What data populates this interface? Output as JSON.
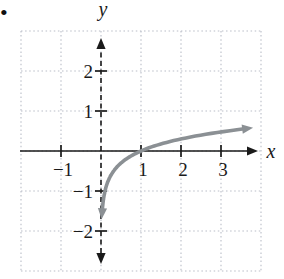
{
  "bullet": {
    "symbol": "•",
    "color": "#111111"
  },
  "chart_data": {
    "type": "line",
    "title": "",
    "function": "y = log10(x)",
    "function_name": "log10",
    "xlabel": "x",
    "ylabel": "y",
    "xlim": [
      -2,
      4
    ],
    "ylim": [
      -3,
      3
    ],
    "x_range_drawn": [
      0.033,
      3.58
    ],
    "x_ticks": [
      {
        "v": -1,
        "label": "−1"
      },
      {
        "v": 1,
        "label": "1"
      },
      {
        "v": 2,
        "label": "2"
      },
      {
        "v": 3,
        "label": "3"
      }
    ],
    "y_ticks": [
      {
        "v": 2,
        "label": "2"
      },
      {
        "v": 1,
        "label": "1"
      },
      {
        "v": -1,
        "label": "−1"
      },
      {
        "v": -2,
        "label": "−2"
      }
    ],
    "grid": true,
    "grid_style": "dotted",
    "asymptote": {
      "axis": "y-axis",
      "x": 0,
      "drawn": "dashed"
    },
    "series": [
      {
        "name": "y = log10(x)",
        "points": [
          [
            0.033,
            -1.48
          ],
          [
            0.1,
            -1
          ],
          [
            0.25,
            -0.6
          ],
          [
            0.5,
            -0.3
          ],
          [
            1,
            0
          ],
          [
            2,
            0.3
          ],
          [
            3,
            0.48
          ],
          [
            3.58,
            0.55
          ]
        ]
      }
    ],
    "key_points": [
      {
        "x": 1,
        "y": 0,
        "note": "x-intercept"
      }
    ],
    "arrows": {
      "curve_both_ends": true,
      "x_axis_right": true,
      "y_axis_top": true,
      "y_axis_bottom": true
    },
    "colors": {
      "curve": "#8b9094",
      "axis": "#1a1a1a",
      "grid": "#b9bdc7",
      "text": "#1a1a1a",
      "background": "#ffffff"
    }
  }
}
